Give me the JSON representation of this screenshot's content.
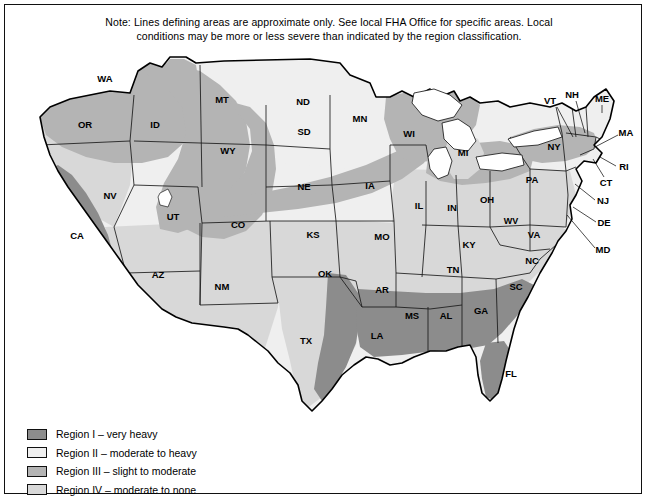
{
  "note": {
    "line1": "Note: Lines defining areas are approximate only. See local FHA Office for specific areas. Local",
    "line2": "conditions may be more or less severe than indicated by the region classification."
  },
  "colors": {
    "region1": "#8c8c8c",
    "region2": "#efefef",
    "region3": "#b4b4b4",
    "region4": "#d8d8d8",
    "outline": "#1a1a1a",
    "background": "#ffffff"
  },
  "legend": {
    "items": [
      {
        "id": "region-1",
        "label": "Region I – very heavy",
        "color": "#8c8c8c"
      },
      {
        "id": "region-2",
        "label": "Region II – moderate to heavy",
        "color": "#efefef"
      },
      {
        "id": "region-3",
        "label": "Region III – slight to moderate",
        "color": "#b4b4b4"
      },
      {
        "id": "region-4",
        "label": "Region IV – moderate to none",
        "color": "#d8d8d8"
      }
    ]
  },
  "map": {
    "title": "United States termite infestation probability map",
    "state_labels": [
      {
        "abbr": "WA",
        "x": 95,
        "y": 34
      },
      {
        "abbr": "OR",
        "x": 75,
        "y": 80
      },
      {
        "abbr": "ID",
        "x": 145,
        "y": 80
      },
      {
        "abbr": "MT",
        "x": 212,
        "y": 55
      },
      {
        "abbr": "ND",
        "x": 293,
        "y": 57
      },
      {
        "abbr": "MN",
        "x": 350,
        "y": 74
      },
      {
        "abbr": "WI",
        "x": 399,
        "y": 89
      },
      {
        "abbr": "MI",
        "x": 453,
        "y": 108
      },
      {
        "abbr": "SD",
        "x": 294,
        "y": 87
      },
      {
        "abbr": "WY",
        "x": 218,
        "y": 106
      },
      {
        "abbr": "NV",
        "x": 100,
        "y": 151
      },
      {
        "abbr": "UT",
        "x": 163,
        "y": 172
      },
      {
        "abbr": "CO",
        "x": 228,
        "y": 180
      },
      {
        "abbr": "NE",
        "x": 294,
        "y": 142
      },
      {
        "abbr": "IA",
        "x": 360,
        "y": 141
      },
      {
        "abbr": "IL",
        "x": 409,
        "y": 161
      },
      {
        "abbr": "IN",
        "x": 442,
        "y": 163
      },
      {
        "abbr": "OH",
        "x": 477,
        "y": 155
      },
      {
        "abbr": "PA",
        "x": 522,
        "y": 135
      },
      {
        "abbr": "NY",
        "x": 544,
        "y": 102
      },
      {
        "abbr": "CA",
        "x": 67,
        "y": 191
      },
      {
        "abbr": "AZ",
        "x": 148,
        "y": 230
      },
      {
        "abbr": "NM",
        "x": 212,
        "y": 242
      },
      {
        "abbr": "KS",
        "x": 303,
        "y": 190
      },
      {
        "abbr": "MO",
        "x": 372,
        "y": 192
      },
      {
        "abbr": "KY",
        "x": 459,
        "y": 200
      },
      {
        "abbr": "WV",
        "x": 501,
        "y": 177
      },
      {
        "abbr": "VA",
        "x": 524,
        "y": 190
      },
      {
        "abbr": "NC",
        "x": 522,
        "y": 216
      },
      {
        "abbr": "TN",
        "x": 443,
        "y": 225
      },
      {
        "abbr": "OK",
        "x": 315,
        "y": 229
      },
      {
        "abbr": "AR",
        "x": 372,
        "y": 245
      },
      {
        "abbr": "TX",
        "x": 296,
        "y": 296
      },
      {
        "abbr": "LA",
        "x": 367,
        "y": 291
      },
      {
        "abbr": "MS",
        "x": 402,
        "y": 271
      },
      {
        "abbr": "AL",
        "x": 436,
        "y": 271
      },
      {
        "abbr": "GA",
        "x": 471,
        "y": 266
      },
      {
        "abbr": "SC",
        "x": 506,
        "y": 242
      },
      {
        "abbr": "FL",
        "x": 501,
        "y": 329
      }
    ],
    "callout_labels": [
      {
        "abbr": "VT",
        "x": 540,
        "y": 56,
        "lx1": 547,
        "ly1": 62,
        "lx2": 563,
        "ly2": 92
      },
      {
        "abbr": "NH",
        "x": 562,
        "y": 50,
        "lx1": 566,
        "ly1": 56,
        "lx2": 575,
        "ly2": 88
      },
      {
        "abbr": "ME",
        "x": 592,
        "y": 54,
        "lx1": 592,
        "ly1": 60,
        "lx2": 592,
        "ly2": 68
      },
      {
        "abbr": "MA",
        "x": 616,
        "y": 88,
        "lx1": 608,
        "ly1": 90,
        "lx2": 585,
        "ly2": 102
      },
      {
        "abbr": "RI",
        "x": 614,
        "y": 122,
        "lx1": 606,
        "ly1": 121,
        "lx2": 590,
        "ly2": 112
      },
      {
        "abbr": "CT",
        "x": 596,
        "y": 138,
        "lx1": 594,
        "ly1": 132,
        "lx2": 583,
        "ly2": 114
      },
      {
        "abbr": "NJ",
        "x": 593,
        "y": 156,
        "lx1": 585,
        "ly1": 155,
        "lx2": 565,
        "ly2": 139
      },
      {
        "abbr": "DE",
        "x": 594,
        "y": 178,
        "lx1": 586,
        "ly1": 177,
        "lx2": 563,
        "ly2": 162
      },
      {
        "abbr": "MD",
        "x": 593,
        "y": 205,
        "lx1": 585,
        "ly1": 203,
        "lx2": 557,
        "ly2": 170
      }
    ]
  }
}
